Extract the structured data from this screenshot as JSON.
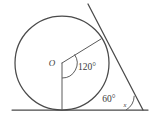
{
  "figure": {
    "type": "geometry-diagram",
    "background_color": "#ffffff",
    "stroke_color": "#4a4a4a",
    "labels": {
      "center": "O",
      "central_angle": "120°",
      "external_angle": "60°",
      "unknown_angle": "x"
    },
    "geometry": {
      "circle": {
        "cx": 62,
        "cy": 63,
        "r": 47
      },
      "baseline": {
        "x1": 12,
        "y1": 110,
        "x2": 148,
        "y2": 110
      },
      "tangent_line": {
        "x1": 88,
        "y1": 4,
        "x2": 143,
        "y2": 110
      },
      "radius_to_tangent_point": {
        "x1": 62,
        "y1": 63,
        "x2": 101,
        "y2": 39
      },
      "radius_to_baseline": {
        "x1": 62,
        "y1": 63,
        "x2": 62,
        "y2": 110
      },
      "vertex": {
        "x": 143,
        "y": 110
      }
    }
  }
}
